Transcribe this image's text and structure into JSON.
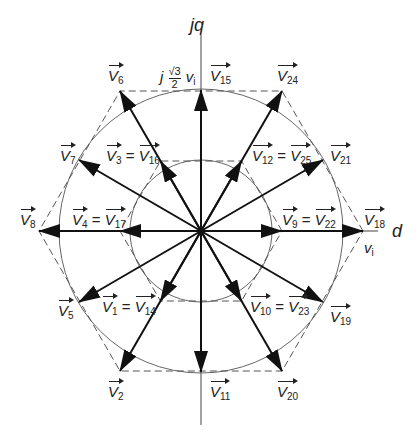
{
  "axes": {
    "d": "d",
    "q": "jq"
  },
  "annotations": {
    "q_tick_prefix": "j",
    "q_tick_num": "√3",
    "q_tick_den": "2",
    "q_tick_suffix": "v",
    "q_tick_suffix_sub": "i",
    "d_tick": "v",
    "d_tick_sub": "i"
  },
  "vectors": {
    "v6": "6",
    "v15": "15",
    "v24": "24",
    "v7": "7",
    "v3": "3",
    "v16": "16",
    "v12": "12",
    "v25": "25",
    "v21": "21",
    "v8": "8",
    "v4": "4",
    "v17": "17",
    "v9": "9",
    "v22": "22",
    "v18": "18",
    "v5": "5",
    "v1": "1",
    "v14": "14",
    "v10": "10",
    "v23": "23",
    "v19": "19",
    "v2": "2",
    "v11": "11",
    "v20": "20",
    "name": "V",
    "eq": "="
  }
}
